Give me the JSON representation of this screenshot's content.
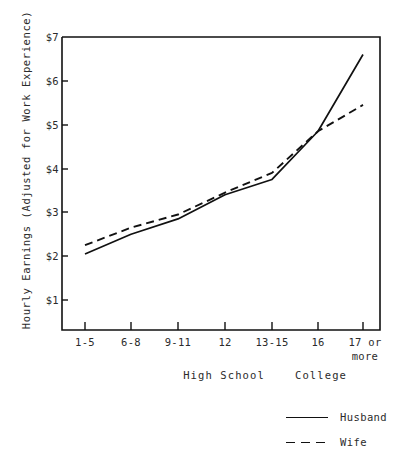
{
  "chart_data": {
    "type": "line",
    "title": "",
    "xlabel": "",
    "ylabel": "Hourly Earnings (Adjusted for Work Experience)",
    "categories": [
      "1-5",
      "6-8",
      "9-11",
      "12",
      "13-15",
      "16",
      "17 or more"
    ],
    "category_lines": [
      [
        "1-5"
      ],
      [
        "6-8"
      ],
      [
        "9-11"
      ],
      [
        "12"
      ],
      [
        "13-15"
      ],
      [
        "16"
      ],
      [
        "17 or",
        "more"
      ]
    ],
    "group_labels": [
      "High School",
      "College"
    ],
    "ytick_labels": [
      "$1",
      "$2",
      "$3",
      "$4",
      "$5",
      "$6",
      "$7"
    ],
    "ytick_values": [
      1,
      2,
      3,
      4,
      5,
      6,
      7
    ],
    "ylim": [
      0,
      7
    ],
    "grid": false,
    "legend_position": "bottom-right",
    "series": [
      {
        "name": "Husband",
        "style": "solid",
        "color": "#111111",
        "values": [
          2.05,
          2.5,
          2.85,
          3.4,
          3.75,
          4.85,
          6.6
        ]
      },
      {
        "name": "Wife",
        "style": "dashed",
        "color": "#111111",
        "values": [
          2.25,
          2.65,
          2.95,
          3.45,
          3.9,
          4.85,
          5.45
        ]
      }
    ]
  },
  "axis": {
    "y_title": "Hourly Earnings (Adjusted for Work Experience)",
    "ticks_y": [
      "$7",
      "$6",
      "$5",
      "$4",
      "$3",
      "$2",
      "$1"
    ]
  },
  "groups": {
    "high_school": "High School",
    "college": "College"
  },
  "legend": {
    "husband": "Husband",
    "wife": "Wife"
  }
}
